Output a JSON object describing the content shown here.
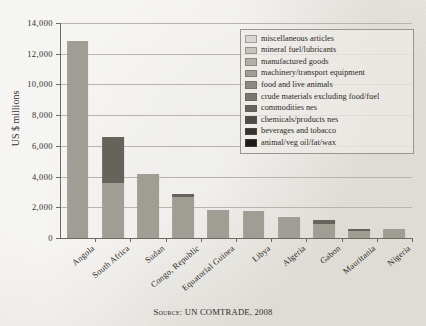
{
  "chart_data": {
    "type": "bar",
    "subtype": "stacked-bar",
    "title": "",
    "xlabel": "",
    "ylabel": "US $ millions",
    "ylim": [
      0,
      14000
    ],
    "ytick_values": [
      0,
      2000,
      4000,
      6000,
      8000,
      10000,
      12000,
      14000
    ],
    "ytick_labels": [
      "0",
      "2,000",
      "4,000",
      "6,000",
      "8,000",
      "10,000",
      "12,000",
      "14,000"
    ],
    "grid": true,
    "legend_position": "top-right",
    "categories": [
      "Angola",
      "South Africa",
      "Sudan",
      "Congo, Republic",
      "Equatorial Guinea",
      "Libya",
      "Algeria",
      "Gabon",
      "Mauritania",
      "Nigeria"
    ],
    "series": [
      {
        "name": "miscellaneous articles",
        "color": "#d9d7d1",
        "values": [
          0,
          0,
          0,
          0,
          0,
          0,
          0,
          0,
          0,
          0
        ]
      },
      {
        "name": "mineral fuel/lubricants",
        "color": "#c6c4bd",
        "values": [
          0,
          0,
          0,
          0,
          0,
          0,
          0,
          0,
          0,
          0
        ]
      },
      {
        "name": "manufactured goods",
        "color": "#b3b0a8",
        "values": [
          0,
          0,
          0,
          0,
          0,
          0,
          0,
          0,
          0,
          0
        ]
      },
      {
        "name": "machinery/transport equipment",
        "color": "#a09d94",
        "values": [
          12850,
          3600,
          4150,
          2700,
          1800,
          1750,
          1350,
          900,
          470,
          600
        ]
      },
      {
        "name": "food and live animals",
        "color": "#8d8a81",
        "values": [
          0,
          0,
          0,
          0,
          0,
          0,
          0,
          0,
          0,
          0
        ]
      },
      {
        "name": "crude materials excluding food/fuel",
        "color": "#7a776e",
        "values": [
          0,
          0,
          0,
          0,
          0,
          0,
          0,
          0,
          0,
          0
        ]
      },
      {
        "name": "commodities nes",
        "color": "#66635b",
        "values": [
          0,
          3000,
          0,
          150,
          0,
          0,
          0,
          250,
          130,
          0
        ]
      },
      {
        "name": "chemicals/products nes",
        "color": "#4f4c46",
        "values": [
          0,
          0,
          0,
          0,
          0,
          0,
          0,
          0,
          0,
          0
        ]
      },
      {
        "name": "beverages and tobacco",
        "color": "#35332f",
        "values": [
          0,
          0,
          0,
          0,
          0,
          0,
          0,
          0,
          0,
          0
        ]
      },
      {
        "name": "animal/veg oil/fat/wax",
        "color": "#1c1b19",
        "values": [
          0,
          0,
          0,
          0,
          0,
          0,
          0,
          0,
          0,
          0
        ]
      }
    ],
    "totals": [
      12850,
      6600,
      4150,
      2850,
      1800,
      1750,
      1350,
      1150,
      600,
      600
    ]
  },
  "caption": {
    "source": "Source: UN COMTRADE, 2008"
  },
  "colors": {
    "background": "#eceae5",
    "axis": "#6d6a64",
    "grid": "#b9b5ad",
    "text": "#2b2926"
  }
}
